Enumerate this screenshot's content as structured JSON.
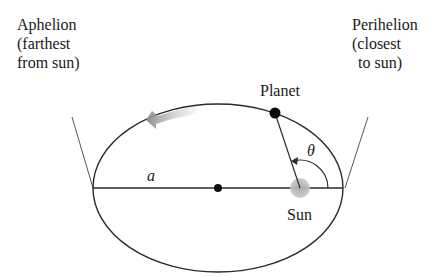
{
  "figure": {
    "labels": {
      "aphelion": [
        "Aphelion",
        "(farthest",
        "from sun)"
      ],
      "perihelion": [
        "Perihelion",
        "(closest",
        "to sun)"
      ],
      "planet": "Planet",
      "sun": "Sun",
      "semi_major_axis": "a",
      "angle": "θ"
    },
    "geometry": {
      "ellipse_center": [
        218,
        188
      ],
      "rx": 125,
      "ry": 84,
      "sun_position": [
        300,
        188
      ],
      "planet_position": [
        275,
        113
      ]
    },
    "colors": {
      "line": "#2a2a2a",
      "sun": "#b5b5b5",
      "arrow": "#9a9a9a",
      "text": "#1a1a1a"
    }
  }
}
